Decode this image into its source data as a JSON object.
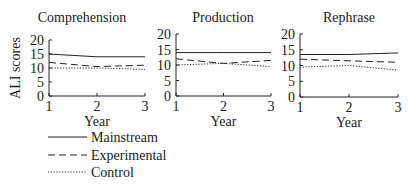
{
  "chart_data": {
    "type": "line",
    "ylabel": "ALI scores",
    "xlabel": "Year",
    "x": [
      1,
      2,
      3
    ],
    "x_ticks": [
      "1",
      "2",
      "3"
    ],
    "y_ticks": [
      "0",
      "5",
      "10",
      "15",
      "20"
    ],
    "ylim": [
      0,
      20
    ],
    "xlim": [
      1,
      3
    ],
    "grid": false,
    "legend": {
      "placement": "bottom-left",
      "entries": [
        {
          "name": "Mainstream",
          "style": "solid"
        },
        {
          "name": "Experimental",
          "style": "dashed"
        },
        {
          "name": "Control",
          "style": "dotted"
        }
      ]
    },
    "panels": [
      {
        "title": "Comprehension",
        "series": [
          {
            "name": "Mainstream",
            "values": [
              15,
              14,
              14
            ]
          },
          {
            "name": "Experimental",
            "values": [
              12,
              10.5,
              11
            ]
          },
          {
            "name": "Control",
            "values": [
              10,
              10,
              9.5
            ]
          }
        ]
      },
      {
        "title": "Production",
        "series": [
          {
            "name": "Mainstream",
            "values": [
              14,
              14,
              14
            ]
          },
          {
            "name": "Experimental",
            "values": [
              12,
              10.5,
              11.5
            ]
          },
          {
            "name": "Control",
            "values": [
              10,
              10.5,
              9.5
            ]
          }
        ]
      },
      {
        "title": "Rephrase",
        "series": [
          {
            "name": "Mainstream",
            "values": [
              13.5,
              13.5,
              14
            ]
          },
          {
            "name": "Experimental",
            "values": [
              12,
              11.5,
              11
            ]
          },
          {
            "name": "Control",
            "values": [
              9.5,
              10,
              8.5
            ]
          }
        ]
      }
    ]
  }
}
